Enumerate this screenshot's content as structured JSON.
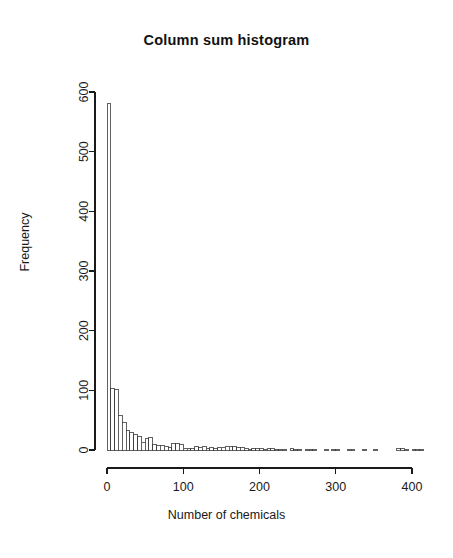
{
  "chart_data": {
    "type": "bar",
    "title": "Column sum histogram",
    "xlabel": "Number of chemicals",
    "ylabel": "Frequency",
    "xlim": [
      0,
      415
    ],
    "ylim": [
      0,
      620
    ],
    "xticks": [
      0,
      100,
      200,
      300,
      400
    ],
    "yticks": [
      0,
      100,
      200,
      300,
      400,
      500,
      600
    ],
    "grid": false,
    "legend": null,
    "bin_width": 5,
    "bin_starts": [
      0,
      5,
      10,
      15,
      20,
      25,
      30,
      35,
      40,
      45,
      50,
      55,
      60,
      65,
      70,
      75,
      80,
      85,
      90,
      95,
      100,
      105,
      110,
      115,
      120,
      125,
      130,
      135,
      140,
      145,
      150,
      155,
      160,
      165,
      170,
      175,
      180,
      185,
      190,
      195,
      200,
      205,
      210,
      215,
      220,
      225,
      230,
      235,
      240,
      245,
      250,
      255,
      260,
      265,
      270,
      275,
      280,
      285,
      290,
      295,
      300,
      305,
      310,
      315,
      320,
      325,
      330,
      335,
      340,
      345,
      350,
      355,
      360,
      365,
      370,
      375,
      380,
      385,
      390,
      395,
      400,
      405,
      410
    ],
    "values": [
      580,
      103,
      102,
      57,
      46,
      32,
      30,
      26,
      22,
      13,
      19,
      21,
      10,
      8,
      7,
      6,
      4,
      11,
      11,
      9,
      3,
      3,
      2,
      6,
      5,
      6,
      3,
      5,
      3,
      4,
      5,
      6,
      6,
      6,
      4,
      4,
      3,
      1,
      2,
      2,
      2,
      1,
      2,
      2,
      1,
      1,
      1,
      0,
      2,
      1,
      1,
      0,
      1,
      1,
      1,
      0,
      0,
      1,
      0,
      1,
      1,
      0,
      0,
      1,
      1,
      0,
      0,
      1,
      0,
      0,
      1,
      0,
      0,
      0,
      0,
      0,
      3,
      3,
      1,
      0,
      1,
      1,
      1
    ]
  },
  "axis": {
    "x_tick_labels": [
      "0",
      "100",
      "200",
      "300",
      "400"
    ],
    "y_tick_labels": [
      "0",
      "100",
      "200",
      "300",
      "400",
      "500",
      "600"
    ]
  }
}
